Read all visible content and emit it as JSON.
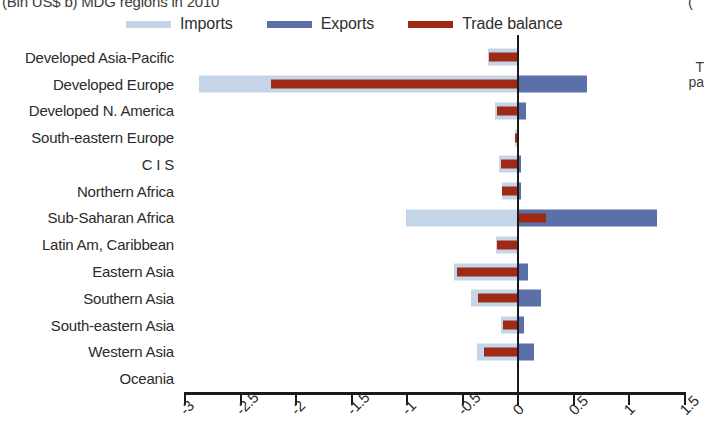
{
  "title": {
    "left_clipped": "(Bln US$ b) MDG regions in 2010",
    "right_clipped": "("
  },
  "right_note": {
    "line1": "T",
    "line2": "pa"
  },
  "colors": {
    "imports": "#c5d5e8",
    "exports": "#5b6fa8",
    "balance": "#9e2a16",
    "axis": "#1a1a1a",
    "text": "#2b2b2b"
  },
  "legend": {
    "items": [
      {
        "label": "Imports",
        "icon": "line-swatch-icon",
        "color": "#c5d5e8"
      },
      {
        "label": "Exports",
        "icon": "line-swatch-icon",
        "color": "#5b6fa8"
      },
      {
        "label": "Trade balance",
        "icon": "line-swatch-icon",
        "color": "#9e2a16"
      }
    ]
  },
  "chart_data": {
    "type": "bar",
    "orientation": "horizontal",
    "title": "(Bln US$ b) MDG regions in 2010",
    "xlabel": "",
    "ylabel": "",
    "xlim": [
      -3,
      1.5
    ],
    "xticks": [
      -3,
      -2.5,
      -2,
      -1.5,
      -1,
      -0.5,
      0,
      0.5,
      1,
      1.5
    ],
    "xticklabels": [
      "-3",
      "-2.5",
      "-2",
      "-1.5",
      "-1",
      "-0.5",
      "0",
      "0.5",
      "1",
      "1.5"
    ],
    "grid": false,
    "legend_position": "top",
    "categories": [
      "Developed Asia-Pacific",
      "Developed Europe",
      "Developed N. America",
      "South-eastern Europe",
      "C I S",
      "Northern Africa",
      "Sub-Saharan Africa",
      "Latin Am, Caribbean",
      "Eastern Asia",
      "Southern Asia",
      "South-eastern Asia",
      "Western Asia",
      "Oceania"
    ],
    "series": [
      {
        "name": "Imports",
        "color": "#c5d5e8",
        "values": [
          -0.27,
          -2.87,
          -0.21,
          -0.03,
          -0.17,
          -0.15,
          -1.01,
          -0.2,
          -0.58,
          -0.43,
          -0.16,
          -0.37,
          0.0
        ]
      },
      {
        "name": "Exports",
        "color": "#5b6fa8",
        "values": [
          0.01,
          0.62,
          0.07,
          0.01,
          0.02,
          0.02,
          1.25,
          0.01,
          0.09,
          0.2,
          0.05,
          0.14,
          0.0
        ]
      },
      {
        "name": "Trade balance",
        "color": "#9e2a16",
        "balance_spans": [
          {
            "from": -0.26,
            "to": 0.0
          },
          {
            "from": -2.23,
            "to": 0.0
          },
          {
            "from": -0.19,
            "to": 0.0
          },
          {
            "from": -0.03,
            "to": 0.0
          },
          {
            "from": -0.16,
            "to": 0.0
          },
          {
            "from": -0.15,
            "to": 0.0
          },
          {
            "from": 0.0,
            "to": 0.25
          },
          {
            "from": -0.19,
            "to": 0.0
          },
          {
            "from": -0.55,
            "to": 0.0
          },
          {
            "from": -0.36,
            "to": 0.0
          },
          {
            "from": -0.14,
            "to": 0.0
          },
          {
            "from": -0.31,
            "to": 0.0
          },
          {
            "from": 0.0,
            "to": 0.0
          }
        ],
        "values": [
          -0.26,
          -2.23,
          -0.19,
          -0.03,
          -0.16,
          -0.15,
          0.25,
          -0.19,
          -0.55,
          -0.36,
          -0.14,
          -0.31,
          0.0
        ]
      }
    ]
  }
}
